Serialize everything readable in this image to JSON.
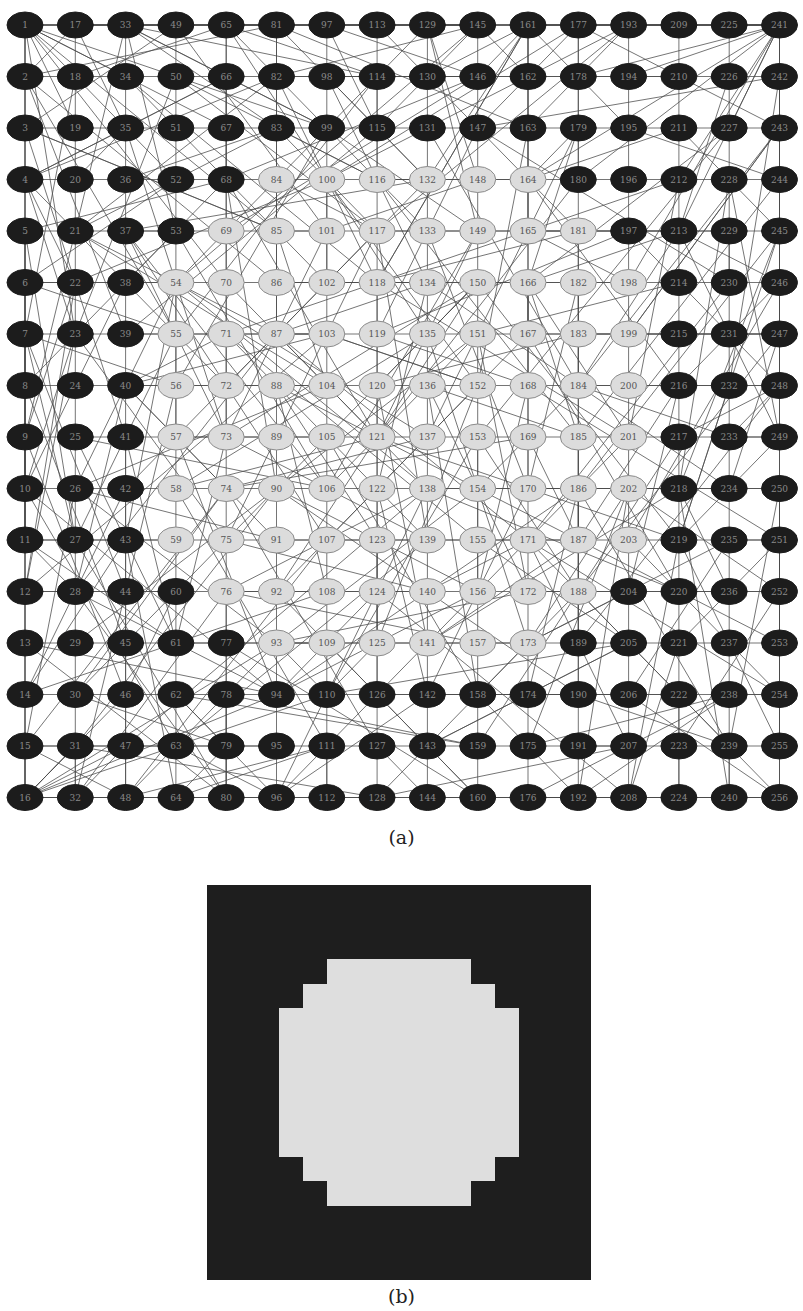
{
  "figure": {
    "captions": {
      "a": "(a)",
      "b": "(b)"
    }
  },
  "graph": {
    "grid_size": 16,
    "numbering": "column-major: node = 16*(col-1) + row",
    "layout": {
      "x0": 25,
      "dx": 50.3,
      "y0": 25,
      "dy": 51.5,
      "node_rx": 18,
      "node_ry": 13
    },
    "colors": {
      "dark_fill": "#1c1c1c",
      "dark_label": "#8a8a8a",
      "light_fill": "#dcdcdc",
      "light_stroke": "#8c8c8c",
      "light_label": "#555555",
      "edge": "#4a4a4a"
    },
    "light_ranges_by_row": [
      {
        "row": 4,
        "cols": [
          6,
          11
        ]
      },
      {
        "row": 5,
        "cols": [
          5,
          12
        ]
      },
      {
        "row": 6,
        "cols": [
          4,
          13
        ]
      },
      {
        "row": 7,
        "cols": [
          4,
          13
        ]
      },
      {
        "row": 8,
        "cols": [
          4,
          13
        ]
      },
      {
        "row": 9,
        "cols": [
          4,
          13
        ]
      },
      {
        "row": 10,
        "cols": [
          4,
          13
        ]
      },
      {
        "row": 11,
        "cols": [
          4,
          13
        ]
      },
      {
        "row": 12,
        "cols": [
          5,
          12
        ]
      },
      {
        "row": 13,
        "cols": [
          6,
          11
        ]
      }
    ],
    "light_nodes": [
      84,
      100,
      116,
      132,
      148,
      164,
      69,
      85,
      101,
      117,
      133,
      149,
      165,
      181,
      54,
      70,
      86,
      102,
      118,
      134,
      150,
      166,
      182,
      198,
      55,
      71,
      87,
      103,
      119,
      135,
      151,
      167,
      183,
      199,
      56,
      72,
      88,
      104,
      120,
      136,
      152,
      168,
      184,
      200,
      57,
      73,
      89,
      105,
      121,
      137,
      153,
      169,
      185,
      201,
      58,
      74,
      90,
      106,
      122,
      138,
      154,
      170,
      186,
      202,
      59,
      75,
      91,
      107,
      123,
      139,
      155,
      171,
      187,
      203,
      76,
      92,
      108,
      124,
      140,
      156,
      172,
      188,
      93,
      109,
      125,
      141,
      157,
      173
    ],
    "edges": {
      "lattice": "4-neighbour grid edges between all adjacent nodes",
      "random_long_range": {
        "count": 520,
        "seed": 7,
        "max_span": 6
      }
    }
  },
  "image_b": {
    "type": "binary 16x16 label map",
    "same_pattern_as": "graph.light_ranges_by_row",
    "colors": {
      "dark": "#1e1e1e",
      "light": "#dedede"
    }
  }
}
